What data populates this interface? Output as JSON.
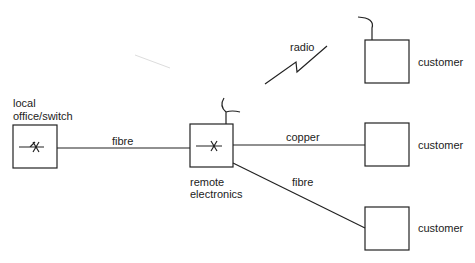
{
  "diagram": {
    "nodes": {
      "local_office": {
        "label_line1": "local",
        "label_line2": "office/switch"
      },
      "remote_electronics": {
        "label_line1": "remote",
        "label_line2": "electronics"
      },
      "customer_radio": {
        "label": "customer"
      },
      "customer_copper": {
        "label": "customer"
      },
      "customer_fibre": {
        "label": "customer"
      }
    },
    "links": {
      "office_to_remote": {
        "label": "fibre"
      },
      "remote_to_customer_radio": {
        "label": "radio"
      },
      "remote_to_customer_copper": {
        "label": "copper"
      },
      "remote_to_customer_fibre": {
        "label": "fibre"
      }
    },
    "colors": {
      "stroke": "#222222",
      "background": "#ffffff"
    }
  }
}
